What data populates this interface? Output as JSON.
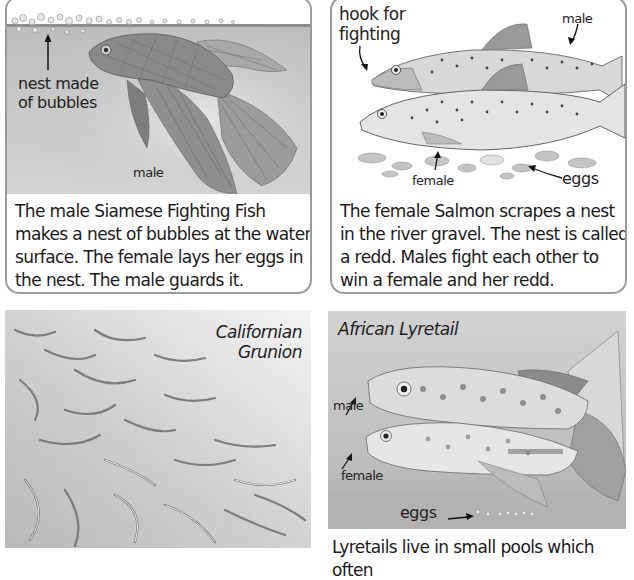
{
  "panels": {
    "fighting_fish": {
      "labels": {
        "nest": "nest made of bubbles",
        "nest_line1": "nest made",
        "nest_line2": "of bubbles",
        "male": "male"
      },
      "caption_lines": [
        "The male Siamese Fighting Fish",
        "makes a nest of bubbles at the water",
        "surface. The female lays her eggs in",
        "the nest. The male guards it."
      ]
    },
    "salmon": {
      "labels": {
        "hook_line1": "hook for",
        "hook_line2": "fighting",
        "male": "male",
        "female": "female",
        "eggs": "eggs"
      },
      "caption_lines": [
        "The female Salmon scrapes a nest",
        "in the river gravel. The nest is called",
        "a redd. Males fight each other to",
        "win a female and her redd."
      ]
    },
    "grunion": {
      "title_line1": "Californian",
      "title_line2": "Grunion"
    },
    "lyretail": {
      "title": "African Lyretail",
      "labels": {
        "male": "male",
        "female": "female",
        "eggs": "eggs"
      },
      "caption_lines": [
        "Lyretails live in small pools which often"
      ]
    }
  },
  "colors": {
    "border": "#9a9a9a",
    "water": "#c9c9c9",
    "text": "#1a1a1a"
  }
}
